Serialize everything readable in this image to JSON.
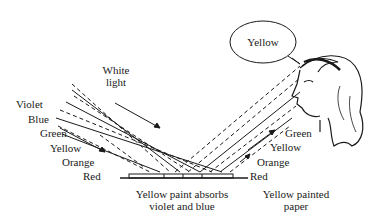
{
  "diagram": {
    "speech_bubble": {
      "text": "Yellow"
    },
    "incoming_label": {
      "line1": "White",
      "line2": "light"
    },
    "incoming_colors": [
      "Violet",
      "Blue",
      "Green",
      "Yellow",
      "Orange",
      "Red"
    ],
    "reflected_colors": [
      "Green",
      "Yellow",
      "Orange",
      "Red"
    ],
    "surface_caption": {
      "line1": "Yellow paint absorbs",
      "line2": "violet and blue"
    },
    "paper_caption": {
      "line1": "Yellow painted",
      "line2": "paper"
    },
    "colors": {
      "ink": "#1a1a1a",
      "background": "#ffffff"
    }
  }
}
